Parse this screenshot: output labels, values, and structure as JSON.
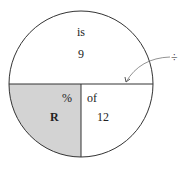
{
  "diagram": {
    "type": "percent-circle",
    "top_half": {
      "label": "is",
      "value": "9"
    },
    "bottom_left": {
      "label": "%",
      "value": "R",
      "shaded": true
    },
    "bottom_right": {
      "label": "of",
      "value": "12"
    },
    "divider_annotation": "÷",
    "colors": {
      "shade": "#d3d3d3",
      "stroke": "#333333",
      "arrow": "#777777"
    }
  }
}
